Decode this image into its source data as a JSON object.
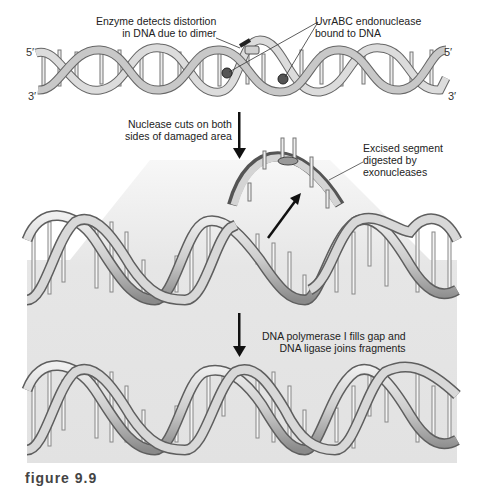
{
  "figure": {
    "type": "DNA excision repair diagram",
    "colors": {
      "panel": "#e6e6e6",
      "panel_light": "#f2f2f2",
      "ribbon_light": "#d8d8d8",
      "ribbon_dark": "#6e6e6e",
      "arrow": "#111111",
      "text": "#222222"
    }
  },
  "top_strand": {
    "end_labels": {
      "top_left": "5′",
      "bottom_left": "3′",
      "top_right": "5′",
      "bottom_right": "3′"
    }
  },
  "annotations": {
    "enzyme_detects": [
      "Enzyme detects distortion",
      "in DNA due to dimer"
    ],
    "uvrabc": [
      "UvrABC endonuclease",
      "bound to DNA"
    ],
    "nuclease_cuts": [
      "Nuclease cuts on both",
      "sides of damaged area"
    ],
    "excised_segment": [
      "Excised segment",
      "digested by",
      "exonucleases"
    ],
    "polymerase": [
      "DNA polymerase I fills gap and",
      "DNA ligase joins fragments"
    ]
  },
  "caption": "figure 9.9"
}
